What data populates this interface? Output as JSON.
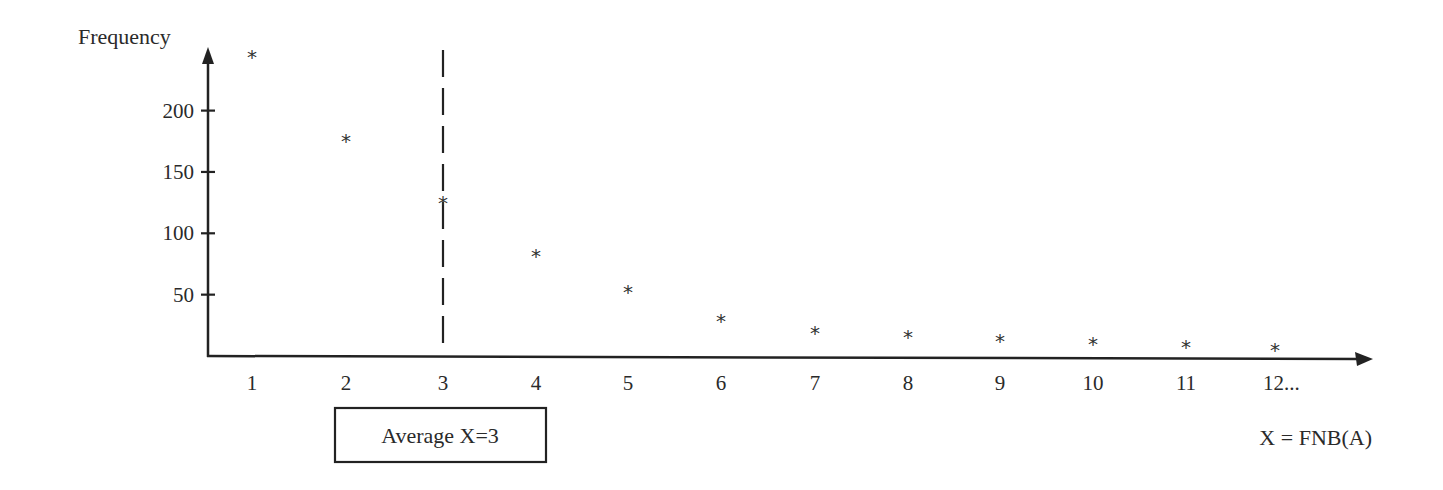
{
  "chart_data": {
    "type": "scatter",
    "title": "",
    "xlabel": "X = FNB(A)",
    "ylabel": "Frequency",
    "x": [
      1,
      2,
      3,
      4,
      5,
      6,
      7,
      8,
      9,
      10,
      11,
      12
    ],
    "x_tick_labels": [
      "1",
      "2",
      "3",
      "4",
      "5",
      "6",
      "7",
      "8",
      "9",
      "10",
      "11",
      "12..."
    ],
    "y_ticks": [
      50,
      100,
      150,
      200
    ],
    "y_tick_labels": [
      "50",
      "100",
      "150",
      "200"
    ],
    "series": [
      {
        "name": "Frequency",
        "marker": "*",
        "values": [
          246,
          178,
          127,
          84,
          55,
          31,
          21,
          18,
          15,
          12,
          10,
          7
        ]
      }
    ],
    "ylim": [
      0,
      250
    ],
    "xlim": [
      0.5,
      13
    ],
    "grid": false,
    "legend": "none",
    "annotations": [
      {
        "type": "vline",
        "x": 3,
        "style": "dashed",
        "label": "Average X=3"
      },
      {
        "type": "boxed-text",
        "text": "Average X=3",
        "position": "below x-axis, under x=2..4"
      }
    ]
  },
  "labels": {
    "y_axis_title": "Frequency",
    "x_axis_title": "X = FNB(A)",
    "average_box": "Average X=3",
    "marker_glyph": "*"
  },
  "colors": {
    "ink": "#2a2a2a",
    "background": "#ffffff"
  }
}
